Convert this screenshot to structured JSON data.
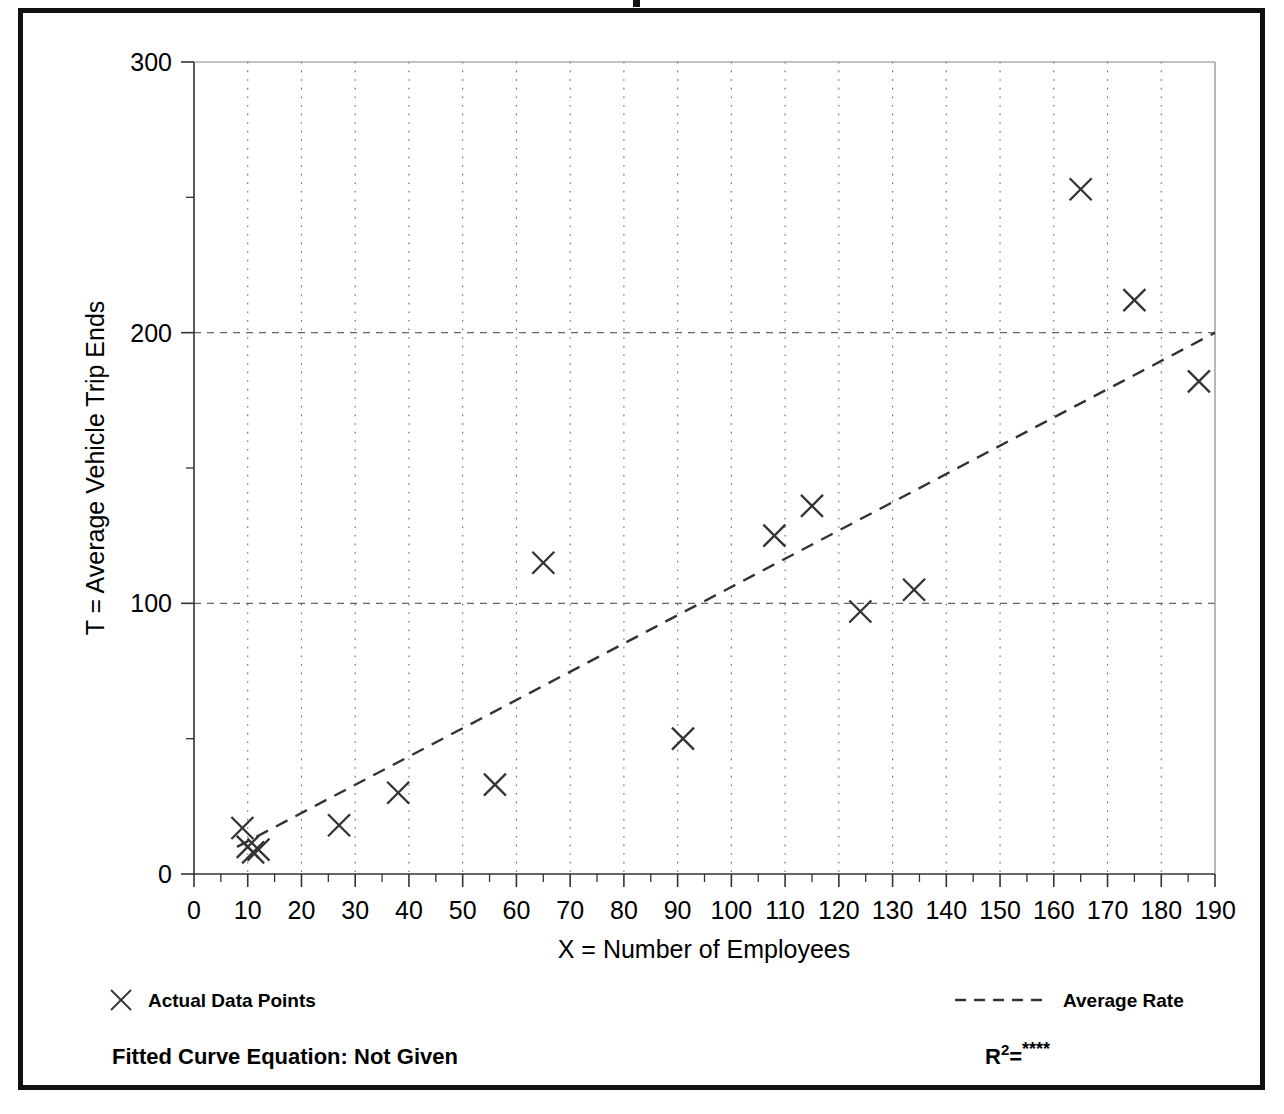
{
  "figure": {
    "border_color": "#111111",
    "background": "#ffffff",
    "top_nick": "page-number-mark"
  },
  "chart_data": {
    "type": "scatter",
    "title": "",
    "xlabel": "X = Number of Employees",
    "ylabel": "T = Average Vehicle Trip Ends",
    "xlim": [
      0,
      190
    ],
    "ylim": [
      0,
      300
    ],
    "x_ticks": [
      0,
      10,
      20,
      30,
      40,
      50,
      60,
      70,
      80,
      90,
      100,
      110,
      120,
      130,
      140,
      150,
      160,
      170,
      180,
      190
    ],
    "x_tick_labels": [
      "0",
      "10",
      "20",
      "30",
      "40",
      "50",
      "60",
      "70",
      "80",
      "90",
      "100",
      "110",
      "120",
      "130",
      "140",
      "150",
      "160",
      "170",
      "180",
      "190"
    ],
    "y_ticks": [
      0,
      100,
      200,
      300
    ],
    "y_tick_labels": [
      "0",
      "100",
      "200",
      "300"
    ],
    "y_minor_ticks": [
      50,
      150,
      250
    ],
    "grid": {
      "vertical": "dotted at every 10 units",
      "horizontal": "dashed at 100 and 200"
    },
    "marker": "x",
    "marker_color": "#333333",
    "points": [
      {
        "x": 9,
        "y": 17
      },
      {
        "x": 10,
        "y": 10
      },
      {
        "x": 11,
        "y": 8
      },
      {
        "x": 12,
        "y": 9
      },
      {
        "x": 27,
        "y": 18
      },
      {
        "x": 38,
        "y": 30
      },
      {
        "x": 56,
        "y": 33
      },
      {
        "x": 65,
        "y": 115
      },
      {
        "x": 91,
        "y": 50
      },
      {
        "x": 108,
        "y": 125
      },
      {
        "x": 115,
        "y": 136
      },
      {
        "x": 124,
        "y": 97
      },
      {
        "x": 134,
        "y": 105
      },
      {
        "x": 165,
        "y": 253
      },
      {
        "x": 175,
        "y": 212
      },
      {
        "x": 187,
        "y": 182
      }
    ],
    "trendline": {
      "name": "Average Rate",
      "style": "dashed",
      "color": "#333333",
      "x0": 8,
      "y0": 10,
      "x1": 190,
      "y1": 200
    },
    "legend": {
      "position": "below-axes",
      "entries": [
        {
          "marker": "x",
          "label": "Actual Data Points"
        },
        {
          "marker": "dashed-line",
          "label": "Average Rate"
        }
      ]
    },
    "annotations": {
      "fitted_curve_equation_label": "Fitted Curve Equation:  Not Given",
      "r2_prefix": "R",
      "r2_superscript": "2",
      "r2_equals": "=",
      "r2_value": "****"
    }
  }
}
